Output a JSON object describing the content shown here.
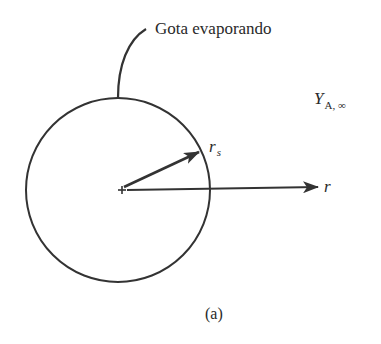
{
  "figure": {
    "caption": "(a)",
    "droplet_label": "Gota evaporando",
    "ambient_label": {
      "symbol": "Y",
      "subscript": "A, ∞"
    },
    "radius_label": {
      "symbol": "r",
      "subscript": "s"
    },
    "axis_label": "r",
    "colors": {
      "stroke": "#333333",
      "text": "#2a2a2a",
      "background": "#ffffff"
    },
    "geometry": {
      "circle_center": [
        118,
        190
      ],
      "circle_radius": 92,
      "origin_marker": [
        122,
        190
      ]
    }
  }
}
